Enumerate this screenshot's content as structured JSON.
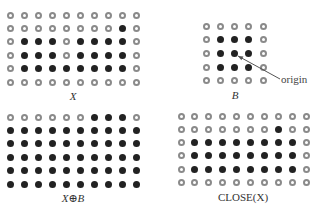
{
  "panels": [
    {
      "id": "X",
      "label": "X",
      "origin_x": 10,
      "origin_y": 15,
      "dx": 14.1,
      "dy": 13.4,
      "label_x": 73,
      "label_y": 90,
      "grid": [
        "0000000000",
        "0000000010",
        "0111011110",
        "0111011110",
        "0111111110",
        "0000000000"
      ]
    },
    {
      "id": "B",
      "label": "B",
      "origin_x": 206,
      "origin_y": 26,
      "dx": 14.3,
      "dy": 13.7,
      "label_x": 235,
      "label_y": 89,
      "grid": [
        "00000",
        "01110",
        "01110",
        "01110",
        "00000"
      ]
    },
    {
      "id": "dilation",
      "label": "X⊕B",
      "origin_x": 10,
      "origin_y": 117,
      "dx": 14.1,
      "dy": 13.4,
      "label_x": 73,
      "label_y": 192,
      "grid": [
        "0000001110",
        "1111111111",
        "1111111111",
        "1111111111",
        "1111111111",
        "1111111111"
      ]
    },
    {
      "id": "close",
      "label": "CLOSE(X)",
      "origin_x": 181,
      "origin_y": 116,
      "dx": 13.9,
      "dy": 13.3,
      "label_x": 243,
      "label_y": 191,
      "grid": [
        "0000000000",
        "0000000100",
        "0111111110",
        "0111111110",
        "0111111110",
        "0000000000"
      ]
    }
  ],
  "annotation": {
    "text": "origin",
    "text_x": 281,
    "text_y": 73,
    "arrow_from": [
      280,
      79
    ],
    "arrow_to": [
      238,
      56
    ]
  },
  "colors": {
    "filled": "#222222",
    "open_ring": "#8a8a8a"
  }
}
